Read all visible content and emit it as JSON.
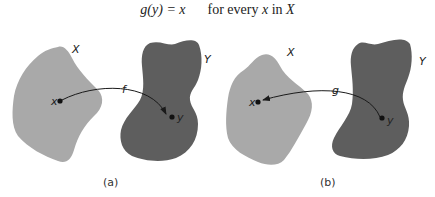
{
  "formula": {
    "lhs": "g(y) = x",
    "rhs_prefix": "for every ",
    "rhs_var": "x",
    "rhs_mid": " in ",
    "rhs_set": "X"
  },
  "panels": [
    {
      "caption": "(a)",
      "set_x_label": "X",
      "set_y_label": "Y",
      "point_x_label": "x",
      "point_y_label": "y",
      "arrow_label": "f",
      "arrow_direction": "x-to-y"
    },
    {
      "caption": "(b)",
      "set_x_label": "X",
      "set_y_label": "Y",
      "point_x_label": "x",
      "point_y_label": "y",
      "arrow_label": "g",
      "arrow_direction": "y-to-x"
    }
  ],
  "colors": {
    "set_x_fill": "#a9a9a9",
    "set_y_fill": "#5e5e5e",
    "ink": "#1a1a1a"
  }
}
